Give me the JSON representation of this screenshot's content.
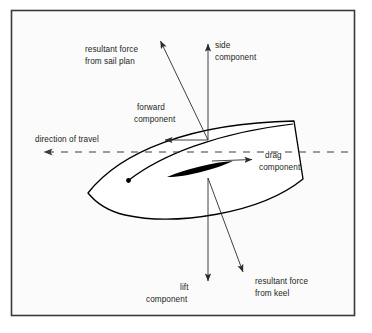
{
  "figure": {
    "frame": {
      "x": 11,
      "y": 10,
      "width": 344,
      "height": 306,
      "background_color": "#fbfbfb",
      "border_color": "#3a3a3a"
    },
    "colors": {
      "page_background": "#ffffff",
      "panel_background": "#fbfbfb",
      "hull_fill": "#ffffff",
      "hull_stroke": "#000000",
      "keel_fill": "#000000",
      "arrow_stroke": "#2b2b2b",
      "text": "#231f20",
      "dashed_line": "#3c3c3c"
    },
    "origin_points": {
      "sail_center_of_effort": {
        "x": 208,
        "y": 140
      },
      "keel_center_of_effort": {
        "x": 208,
        "y": 178
      },
      "hull_marker_dot": {
        "x": 128,
        "y": 180
      }
    },
    "labels": [
      {
        "id": "resultant-force-from-sail-plan",
        "lines": [
          "resultant force",
          "from sail plan"
        ],
        "x": 85,
        "y": 52,
        "anchor": "start"
      },
      {
        "id": "side-component",
        "lines": [
          "side",
          "component"
        ],
        "x": 215,
        "y": 48,
        "anchor": "start"
      },
      {
        "id": "forward-component",
        "lines": [
          "forward",
          "component"
        ],
        "x": 137,
        "y": 110,
        "anchor": "start"
      },
      {
        "id": "direction-of-travel",
        "lines": [
          "direction of travel"
        ],
        "x": 35,
        "y": 142,
        "anchor": "start"
      },
      {
        "id": "drag-component",
        "lines": [
          "drag",
          "component"
        ],
        "x": 265,
        "y": 158,
        "anchor": "start"
      },
      {
        "id": "lift-component",
        "lines": [
          "lift",
          "component"
        ],
        "x": 146,
        "y": 290,
        "anchor": "start"
      },
      {
        "id": "resultant-force-from-keel",
        "lines": [
          "resultant force",
          "from keel"
        ],
        "x": 255,
        "y": 284,
        "anchor": "start"
      }
    ],
    "vectors": [
      {
        "id": "resultant-force-from-sail-plan-arrow",
        "name": "resultant force from sail plan",
        "from": {
          "x": 208,
          "y": 140
        },
        "to": {
          "x": 159,
          "y": 38
        },
        "arrowhead": "end",
        "style": "solid"
      },
      {
        "id": "side-component-arrow",
        "name": "side component",
        "from": {
          "x": 208,
          "y": 140
        },
        "to": {
          "x": 208,
          "y": 41
        },
        "arrowhead": "end",
        "style": "solid"
      },
      {
        "id": "forward-component-arrow",
        "name": "forward component",
        "from": {
          "x": 208,
          "y": 140
        },
        "to": {
          "x": 160,
          "y": 140
        },
        "arrowhead": "end",
        "style": "solid"
      },
      {
        "id": "drag-component-arrow",
        "name": "drag component",
        "from": {
          "x": 212,
          "y": 161
        },
        "to": {
          "x": 257,
          "y": 159
        },
        "arrowhead": "end",
        "style": "solid"
      },
      {
        "id": "lift-component-arrow",
        "name": "lift component",
        "from": {
          "x": 208,
          "y": 178
        },
        "to": {
          "x": 208,
          "y": 285
        },
        "arrowhead": "end",
        "style": "solid"
      },
      {
        "id": "resultant-force-from-keel-arrow",
        "name": "resultant force from keel",
        "from": {
          "x": 208,
          "y": 178
        },
        "to": {
          "x": 246,
          "y": 277
        },
        "arrowhead": "end",
        "style": "solid"
      },
      {
        "id": "direction-of-travel-line",
        "name": "direction of travel",
        "from": {
          "x": 348,
          "y": 152
        },
        "to": {
          "x": 36,
          "y": 152
        },
        "arrowhead": "end",
        "style": "dashed"
      }
    ],
    "hull": {
      "name": "sailboat hull viewed from above",
      "bow": {
        "x": 88,
        "y": 193
      },
      "transom_top": {
        "x": 294,
        "y": 121
      },
      "transom_bottom": {
        "x": 303,
        "y": 179
      },
      "keel_fin": {
        "tip_forward": {
          "x": 167,
          "y": 177
        },
        "tip_aft": {
          "x": 233,
          "y": 161
        }
      }
    }
  }
}
